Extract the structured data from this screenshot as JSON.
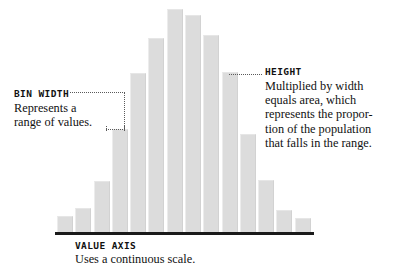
{
  "figure": {
    "type": "annotated-histogram-diagram",
    "background_color": "#ffffff",
    "bar_color": "#dcdcdc",
    "axis_color": "#1a1a1a",
    "leader_color": "#5a5a5a"
  },
  "annotations": {
    "bin_width": {
      "title": "BIN WIDTH",
      "lines": [
        "Represents a",
        "range of values."
      ]
    },
    "height": {
      "title": "HEIGHT",
      "lines": [
        "Multiplied by width",
        "equals area, which",
        "represents the propor-",
        "tion of the population",
        "that falls in the range."
      ]
    },
    "value_axis": {
      "title": "VALUE AXIS",
      "lines": [
        "Uses a continuous scale."
      ]
    }
  },
  "chart_data": {
    "type": "bar",
    "title": "",
    "subtitle": "",
    "xlabel": "VALUE AXIS",
    "ylabel": "",
    "grid": false,
    "legend": "none",
    "xlim": [
      0,
      14
    ],
    "ylim": [
      0,
      228
    ],
    "categories": [
      "1",
      "2",
      "3",
      "4",
      "5",
      "6",
      "7",
      "8",
      "9",
      "10",
      "11",
      "12",
      "13",
      "14"
    ],
    "values": [
      16,
      24,
      50,
      101,
      156,
      191,
      219,
      213,
      194,
      157,
      96,
      51,
      22,
      14
    ],
    "tick_labels": [],
    "annotated_bars": {
      "bin_width_bracket_bar": 4,
      "height_leader_bar": 10
    }
  }
}
